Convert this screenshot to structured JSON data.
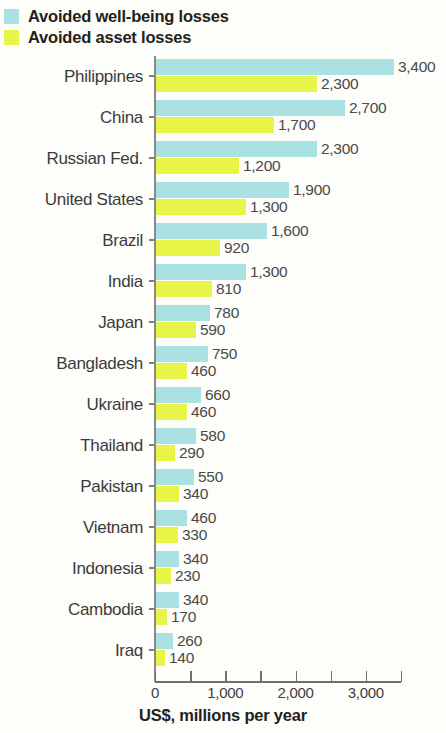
{
  "legend": {
    "items": [
      {
        "label": "Avoided well-being losses",
        "color": "#aae2e3",
        "key": "wellbeing"
      },
      {
        "label": "Avoided asset losses",
        "color": "#e9f448",
        "key": "asset"
      }
    ]
  },
  "axis": {
    "title": "US$, millions per year",
    "tick_labels": [
      "0",
      "1,000",
      "2,000",
      "3,000"
    ],
    "tick_values": [
      0,
      1000,
      2000,
      3000
    ],
    "minor_tick_values": [
      500,
      1500,
      2500,
      3500
    ]
  },
  "chart_data": {
    "type": "bar",
    "orientation": "horizontal",
    "title": "",
    "subtitle": "",
    "xlabel": "US$, millions per year",
    "ylabel": "",
    "xlim": [
      0,
      3500
    ],
    "grid": false,
    "legend_position": "top-left",
    "categories": [
      "Philippines",
      "China",
      "Russian Fed.",
      "United States",
      "Brazil",
      "India",
      "Japan",
      "Bangladesh",
      "Ukraine",
      "Thailand",
      "Pakistan",
      "Vietnam",
      "Indonesia",
      "Cambodia",
      "Iraq"
    ],
    "series": [
      {
        "name": "Avoided well-being losses",
        "color": "#aae2e3",
        "values": [
          3400,
          2700,
          2300,
          1900,
          1600,
          1300,
          780,
          750,
          660,
          580,
          550,
          460,
          340,
          340,
          260
        ],
        "labels": [
          "3,400",
          "2,700",
          "2,300",
          "1,900",
          "1,600",
          "1,300",
          "780",
          "750",
          "660",
          "580",
          "550",
          "460",
          "340",
          "340",
          "260"
        ]
      },
      {
        "name": "Avoided asset losses",
        "color": "#e9f448",
        "values": [
          2300,
          1700,
          1200,
          1300,
          920,
          810,
          590,
          460,
          460,
          290,
          340,
          330,
          230,
          170,
          140
        ],
        "labels": [
          "2,300",
          "1,700",
          "1,200",
          "1,300",
          "920",
          "810",
          "590",
          "460",
          "460",
          "290",
          "340",
          "330",
          "230",
          "170",
          "140"
        ]
      }
    ]
  }
}
